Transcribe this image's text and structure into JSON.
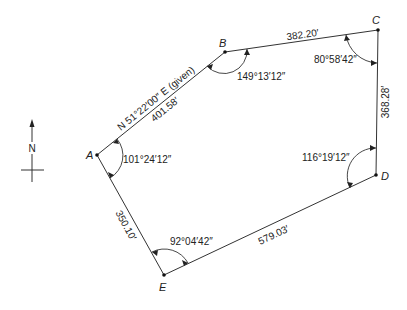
{
  "diagram": {
    "type": "closed traverse",
    "north_arrow": {
      "label": "N"
    },
    "vertices": [
      {
        "id": "A",
        "label": "A",
        "x": 97,
        "y": 155,
        "interior_angle": "101°24′12″"
      },
      {
        "id": "B",
        "label": "B",
        "x": 225,
        "y": 52,
        "interior_angle": "149°13′12″"
      },
      {
        "id": "C",
        "label": "C",
        "x": 378,
        "y": 30,
        "interior_angle": "80°58′42″"
      },
      {
        "id": "D",
        "label": "D",
        "x": 376,
        "y": 175,
        "interior_angle": "116°19′12″"
      },
      {
        "id": "E",
        "label": "E",
        "x": 164,
        "y": 275,
        "interior_angle": "92°04′42″"
      }
    ],
    "courses": [
      {
        "from": "A",
        "to": "B",
        "length": "401.58′",
        "bearing": "N 51°22′00″ E (given)"
      },
      {
        "from": "B",
        "to": "C",
        "length": "382.20′"
      },
      {
        "from": "C",
        "to": "D",
        "length": "368.28′"
      },
      {
        "from": "D",
        "to": "E",
        "length": "579.03′"
      },
      {
        "from": "E",
        "to": "A",
        "length": "350.10′"
      }
    ]
  },
  "labels": {
    "A": "A",
    "B": "B",
    "C": "C",
    "D": "D",
    "E": "E",
    "N": "N",
    "bearing_AB": "N 51°22′00″ E (given)",
    "len_AB": "401.58′",
    "len_BC": "382.20′",
    "len_CD": "368.28′",
    "len_DE": "579.03′",
    "len_EA": "350.10′",
    "angle_A": "101°24′12″",
    "angle_B": "149°13′12″",
    "angle_C": "80°58′42″",
    "angle_D": "116°19′12″",
    "angle_E": "92°04′42″"
  }
}
